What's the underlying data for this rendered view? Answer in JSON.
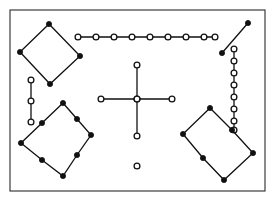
{
  "figure": {
    "width": 275,
    "height": 205,
    "background_color": "#ffffff",
    "frame": {
      "name": "border-frame",
      "x": 10,
      "y": 10,
      "width": 255,
      "height": 181,
      "stroke_color": "#2b2b2b",
      "fill_color": "#ffffff",
      "stroke_width": 1.1
    },
    "style": {
      "edge_color": "#111111",
      "edge_width": 1.3,
      "filled_node_color": "#111111",
      "open_node_fill": "#ffffff",
      "open_node_stroke": "#111111",
      "filled_node_radius": 2.6,
      "open_node_radius": 2.9
    },
    "shapes": [
      {
        "name": "top-left-diamond",
        "kind": "polygon",
        "closed": true,
        "node_style": "filled",
        "points": [
          [
            49,
            24
          ],
          [
            80,
            56
          ],
          [
            50,
            84
          ],
          [
            20,
            52
          ]
        ]
      },
      {
        "name": "top-horizontal-chain",
        "kind": "polyline",
        "closed": false,
        "node_style": "open",
        "points": [
          [
            78,
            37
          ],
          [
            96,
            37
          ],
          [
            114,
            37
          ],
          [
            132,
            37
          ],
          [
            150,
            37
          ],
          [
            168,
            37
          ],
          [
            186,
            37
          ],
          [
            204,
            37
          ],
          [
            215,
            37
          ]
        ]
      },
      {
        "name": "top-right-diagonal-segment",
        "kind": "polyline",
        "closed": false,
        "node_style": "filled",
        "points": [
          [
            222,
            53
          ],
          [
            248,
            23
          ]
        ]
      },
      {
        "name": "right-vertical-chain",
        "kind": "polyline",
        "closed": false,
        "node_style": "open",
        "points": [
          [
            234,
            49
          ],
          [
            234,
            61
          ],
          [
            234,
            73
          ],
          [
            234,
            85
          ],
          [
            234,
            97
          ],
          [
            234,
            109
          ],
          [
            234,
            121
          ],
          [
            234,
            130
          ]
        ]
      },
      {
        "name": "left-short-vertical-chain",
        "kind": "polyline",
        "closed": false,
        "node_style": "open",
        "points": [
          [
            31,
            80
          ],
          [
            31,
            101
          ],
          [
            31,
            122
          ]
        ]
      },
      {
        "name": "center-cross-vertical",
        "kind": "polyline",
        "closed": false,
        "node_style": "open",
        "points": [
          [
            137,
            65
          ],
          [
            137,
            99
          ],
          [
            137,
            136
          ]
        ]
      },
      {
        "name": "center-cross-horizontal",
        "kind": "polyline",
        "closed": false,
        "node_style": "open",
        "points": [
          [
            101,
            99
          ],
          [
            137,
            99
          ],
          [
            172,
            99
          ]
        ]
      },
      {
        "name": "lone-circle-below-cross",
        "kind": "point",
        "closed": false,
        "node_style": "open",
        "points": [
          [
            137,
            166
          ]
        ]
      },
      {
        "name": "bottom-left-rotated-rectangle",
        "kind": "polygon",
        "closed": true,
        "node_style": "filled",
        "points": [
          [
            63,
            103
          ],
          [
            77,
            119
          ],
          [
            91,
            135
          ],
          [
            77,
            155
          ],
          [
            63,
            176
          ],
          [
            42,
            160
          ],
          [
            21,
            143
          ],
          [
            42,
            123
          ]
        ]
      },
      {
        "name": "bottom-right-rotated-rectangle",
        "kind": "polygon",
        "closed": true,
        "node_style": "filled",
        "points": [
          [
            210,
            108
          ],
          [
            232,
            130
          ],
          [
            253,
            153
          ],
          [
            224,
            180
          ],
          [
            203,
            158
          ],
          [
            183,
            134
          ]
        ]
      }
    ]
  }
}
